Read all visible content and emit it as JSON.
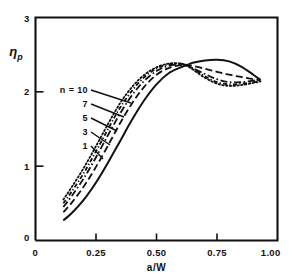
{
  "chart_data": {
    "type": "line",
    "title": "",
    "xlabel": "a/W",
    "ylabel": "ηp",
    "ylabel_main": "η",
    "ylabel_sub": "p",
    "xlim": [
      0,
      1.0
    ],
    "ylim": [
      0,
      3
    ],
    "grid": false,
    "legend_position": "inside-left",
    "legend_prefix": "n =",
    "xticks": [
      0,
      0.25,
      0.5,
      0.75,
      1.0
    ],
    "xtick_labels": [
      "0",
      "0.25",
      "0.50",
      "0.75",
      "1.00"
    ],
    "yticks": [
      0,
      1,
      2,
      3
    ],
    "ytick_labels": [
      "0",
      "1",
      "2",
      "3"
    ],
    "series": [
      {
        "name": "10",
        "label": "n = 10",
        "style": "dotted",
        "points": [
          [
            0.115,
            0.55
          ],
          [
            0.15,
            0.72
          ],
          [
            0.2,
            0.98
          ],
          [
            0.25,
            1.27
          ],
          [
            0.3,
            1.57
          ],
          [
            0.35,
            1.85
          ],
          [
            0.4,
            2.07
          ],
          [
            0.45,
            2.23
          ],
          [
            0.5,
            2.33
          ],
          [
            0.55,
            2.38
          ],
          [
            0.6,
            2.38
          ],
          [
            0.625,
            2.35
          ],
          [
            0.65,
            2.3
          ],
          [
            0.7,
            2.19
          ],
          [
            0.75,
            2.11
          ],
          [
            0.8,
            2.08
          ],
          [
            0.85,
            2.09
          ],
          [
            0.9,
            2.12
          ],
          [
            0.93,
            2.14
          ]
        ]
      },
      {
        "name": "7",
        "label": "7",
        "style": "dashdot-fine",
        "points": [
          [
            0.115,
            0.5
          ],
          [
            0.15,
            0.66
          ],
          [
            0.2,
            0.91
          ],
          [
            0.25,
            1.2
          ],
          [
            0.3,
            1.5
          ],
          [
            0.35,
            1.79
          ],
          [
            0.4,
            2.02
          ],
          [
            0.45,
            2.2
          ],
          [
            0.5,
            2.31
          ],
          [
            0.55,
            2.37
          ],
          [
            0.6,
            2.38
          ],
          [
            0.625,
            2.36
          ],
          [
            0.65,
            2.31
          ],
          [
            0.7,
            2.21
          ],
          [
            0.75,
            2.13
          ],
          [
            0.8,
            2.1
          ],
          [
            0.85,
            2.11
          ],
          [
            0.9,
            2.13
          ],
          [
            0.93,
            2.15
          ]
        ]
      },
      {
        "name": "5",
        "label": "5",
        "style": "dashdot",
        "points": [
          [
            0.115,
            0.45
          ],
          [
            0.15,
            0.6
          ],
          [
            0.2,
            0.84
          ],
          [
            0.25,
            1.12
          ],
          [
            0.3,
            1.42
          ],
          [
            0.35,
            1.71
          ],
          [
            0.4,
            1.96
          ],
          [
            0.45,
            2.15
          ],
          [
            0.5,
            2.28
          ],
          [
            0.55,
            2.35
          ],
          [
            0.6,
            2.37
          ],
          [
            0.625,
            2.36
          ],
          [
            0.65,
            2.32
          ],
          [
            0.7,
            2.24
          ],
          [
            0.75,
            2.17
          ],
          [
            0.8,
            2.13
          ],
          [
            0.85,
            2.13
          ],
          [
            0.9,
            2.15
          ],
          [
            0.93,
            2.16
          ]
        ]
      },
      {
        "name": "3",
        "label": "3",
        "style": "dashed",
        "points": [
          [
            0.115,
            0.38
          ],
          [
            0.15,
            0.51
          ],
          [
            0.2,
            0.73
          ],
          [
            0.25,
            0.99
          ],
          [
            0.3,
            1.28
          ],
          [
            0.35,
            1.58
          ],
          [
            0.4,
            1.85
          ],
          [
            0.45,
            2.07
          ],
          [
            0.5,
            2.23
          ],
          [
            0.55,
            2.32
          ],
          [
            0.6,
            2.36
          ],
          [
            0.625,
            2.36
          ],
          [
            0.65,
            2.35
          ],
          [
            0.7,
            2.31
          ],
          [
            0.75,
            2.27
          ],
          [
            0.8,
            2.23
          ],
          [
            0.85,
            2.2
          ],
          [
            0.9,
            2.17
          ],
          [
            0.93,
            2.16
          ]
        ]
      },
      {
        "name": "1",
        "label": "1",
        "style": "solid",
        "points": [
          [
            0.115,
            0.27
          ],
          [
            0.15,
            0.37
          ],
          [
            0.2,
            0.55
          ],
          [
            0.25,
            0.78
          ],
          [
            0.3,
            1.05
          ],
          [
            0.35,
            1.34
          ],
          [
            0.4,
            1.63
          ],
          [
            0.45,
            1.89
          ],
          [
            0.5,
            2.1
          ],
          [
            0.55,
            2.25
          ],
          [
            0.6,
            2.33
          ],
          [
            0.625,
            2.36
          ],
          [
            0.65,
            2.39
          ],
          [
            0.7,
            2.42
          ],
          [
            0.75,
            2.43
          ],
          [
            0.8,
            2.41
          ],
          [
            0.85,
            2.34
          ],
          [
            0.9,
            2.23
          ],
          [
            0.93,
            2.16
          ]
        ]
      }
    ],
    "legend_entries": [
      {
        "label": "n = 10",
        "series": "10"
      },
      {
        "label": "7",
        "series": "7"
      },
      {
        "label": "5",
        "series": "5"
      },
      {
        "label": "3",
        "series": "3"
      },
      {
        "label": "1",
        "series": "1"
      }
    ],
    "annotations": [
      {
        "text": "crossover",
        "x": 0.62,
        "y": 2.36,
        "visible": false
      }
    ],
    "colors": {
      "line": "#111111",
      "axis": "#111111",
      "background": "#ffffff"
    }
  }
}
